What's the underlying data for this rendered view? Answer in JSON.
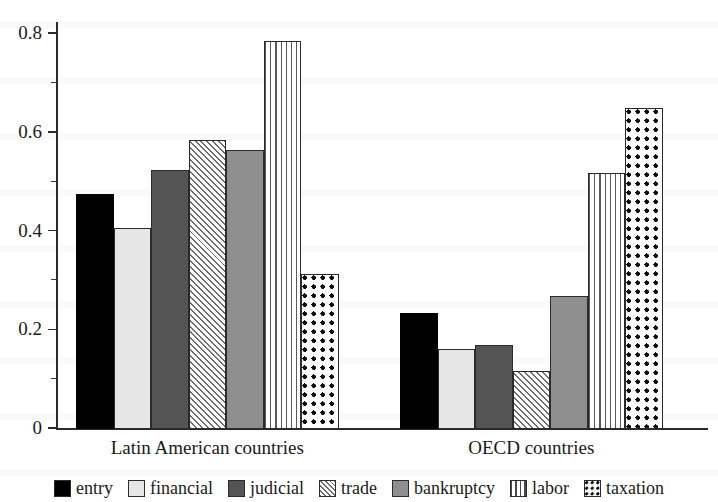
{
  "chart_data": {
    "type": "bar",
    "title": "",
    "subtitle": "",
    "xlabel": "",
    "ylabel": "",
    "categories": [
      "Latin American countries",
      "OECD countries"
    ],
    "series": [
      {
        "name": "entry",
        "values": [
          0.475,
          0.235
        ],
        "pattern": "solid-black",
        "color": "#000000"
      },
      {
        "name": "financial",
        "values": [
          0.408,
          0.162
        ],
        "pattern": "light-gray",
        "color": "#e6e6e6"
      },
      {
        "name": "judicial",
        "values": [
          0.525,
          0.17
        ],
        "pattern": "dark-gray",
        "color": "#545454"
      },
      {
        "name": "trade",
        "values": [
          0.585,
          0.118
        ],
        "pattern": "diagonal",
        "color": "#ffffff"
      },
      {
        "name": "bankruptcy",
        "values": [
          0.565,
          0.27
        ],
        "pattern": "medium-gray",
        "color": "#8f8f8f"
      },
      {
        "name": "labor",
        "values": [
          0.785,
          0.518
        ],
        "pattern": "vertical",
        "color": "#ffffff"
      },
      {
        "name": "taxation",
        "values": [
          0.313,
          0.65
        ],
        "pattern": "checker",
        "color": "#ffffff"
      }
    ],
    "ylim": [
      0,
      0.85
    ],
    "yticks": [
      0,
      0.2,
      0.4,
      0.6,
      0.8
    ],
    "ytick_labels": [
      "0",
      "0.2",
      "0.4",
      "0.6",
      "0.8"
    ],
    "yminor_ticks": [
      0.1,
      0.3,
      0.5,
      0.7
    ],
    "grid": false,
    "legend_position": "bottom",
    "legend_entries": [
      "entry",
      "financial",
      "judicial",
      "trade",
      "bankruptcy",
      "labor",
      "taxation"
    ]
  },
  "axis": {
    "y_labels": [
      "0.8",
      "0.6",
      "0.4",
      "0.2",
      "0"
    ],
    "group_labels": [
      "Latin American countries",
      "OECD countries"
    ]
  },
  "legend": {
    "items": [
      {
        "label": "entry"
      },
      {
        "label": "financial"
      },
      {
        "label": "judicial"
      },
      {
        "label": "trade"
      },
      {
        "label": "bankruptcy"
      },
      {
        "label": "labor"
      },
      {
        "label": "taxation"
      }
    ]
  }
}
